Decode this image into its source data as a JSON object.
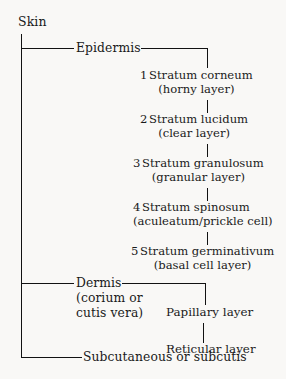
{
  "diagram": {
    "root": {
      "label": "Skin"
    },
    "branches": [
      {
        "label": "Epidermis"
      },
      {
        "label": "Dermis",
        "sub_line_1": "(corium or",
        "sub_line_2": "cutis vera)"
      },
      {
        "label": "Subcutaneous or subcutis"
      }
    ],
    "epidermis_layers": [
      {
        "number": "1",
        "name": "Stratum corneum",
        "alias": "(horny layer)"
      },
      {
        "number": "2",
        "name": "Stratum lucidum",
        "alias": "(clear layer)"
      },
      {
        "number": "3",
        "name": "Stratum granulosum",
        "alias": "(granular layer)"
      },
      {
        "number": "4",
        "name": "Stratum spinosum",
        "alias": "(aculeatum/prickle cell)"
      },
      {
        "number": "5",
        "name": "Stratum germinativum",
        "alias": "(basal cell layer)"
      }
    ],
    "dermis_layers": [
      {
        "label": "Papillary layer"
      },
      {
        "label": "Reticular layer"
      }
    ],
    "colors": {
      "line": "#121212",
      "text": "#1a1a1a",
      "background": "#f9f8f6"
    }
  }
}
